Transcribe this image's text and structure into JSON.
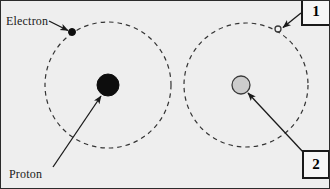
{
  "figure": {
    "background_color": "#eeeeee",
    "border_color": "#2b2b2b",
    "labels": {
      "electron": "Electron",
      "proton": "Proton"
    },
    "callouts": [
      {
        "id": "callout-1",
        "text": "1",
        "points_to": "electron-right"
      },
      {
        "id": "callout-2",
        "text": "2",
        "points_to": "proton-right"
      }
    ],
    "atoms": [
      {
        "name": "left-atom",
        "orbit": {
          "cx": 107,
          "cy": 84,
          "r": 63,
          "style": "dashed",
          "color": "#333333"
        },
        "nucleus": {
          "cx": 107,
          "cy": 84,
          "r": 11,
          "fill": "#0d0d0d",
          "stroke": "#0d0d0d",
          "label": "Proton"
        },
        "electron": {
          "cx": 71,
          "cy": 31,
          "r": 3.5,
          "fill": "#0d0d0d",
          "stroke": "#0d0d0d",
          "label": "Electron"
        }
      },
      {
        "name": "right-atom",
        "orbit": {
          "cx": 245,
          "cy": 84,
          "r": 62,
          "style": "dashed",
          "color": "#333333"
        },
        "nucleus": {
          "cx": 240,
          "cy": 84,
          "r": 9,
          "fill": "#cccccc",
          "stroke": "#3a3a3a",
          "label": "2"
        },
        "electron": {
          "cx": 277,
          "cy": 28,
          "r": 3,
          "fill": "#f2f2f2",
          "stroke": "#3a3a3a",
          "label": "1"
        }
      }
    ],
    "arrows": [
      {
        "name": "electron-arrow",
        "from": [
          48,
          20
        ],
        "to": [
          68,
          30
        ]
      },
      {
        "name": "proton-arrow",
        "from": [
          52,
          166
        ],
        "to": [
          101,
          94
        ]
      },
      {
        "name": "callout-1-arrow",
        "from": [
          299,
          12
        ],
        "to": [
          281,
          27
        ]
      },
      {
        "name": "callout-2-arrow",
        "from": [
          303,
          152
        ],
        "to": [
          246,
          91
        ]
      }
    ]
  }
}
